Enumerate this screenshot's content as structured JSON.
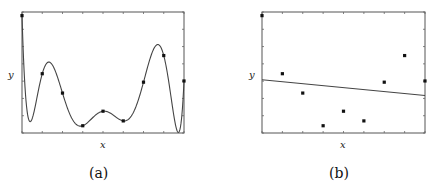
{
  "chart_data": [
    {
      "type": "line",
      "panel": "a",
      "caption": "(a)",
      "xlabel": "x",
      "ylabel": "y",
      "grid": false,
      "x_ticks": 9,
      "y_ticks": 8,
      "points": [
        {
          "x": 0,
          "y": 0.97
        },
        {
          "x": 1,
          "y": 0.49
        },
        {
          "x": 2,
          "y": 0.33
        },
        {
          "x": 3,
          "y": 0.06
        },
        {
          "x": 4,
          "y": 0.18
        },
        {
          "x": 5,
          "y": 0.1
        },
        {
          "x": 6,
          "y": 0.42
        },
        {
          "x": 7,
          "y": 0.64
        },
        {
          "x": 8,
          "y": 0.43
        }
      ],
      "fit": "high-order polynomial interpolating all points"
    },
    {
      "type": "scatter",
      "panel": "b",
      "caption": "(b)",
      "xlabel": "x",
      "ylabel": "y",
      "grid": false,
      "points": [
        {
          "x": 0,
          "y": 0.97
        },
        {
          "x": 1,
          "y": 0.49
        },
        {
          "x": 2,
          "y": 0.33
        },
        {
          "x": 3,
          "y": 0.06
        },
        {
          "x": 4,
          "y": 0.18
        },
        {
          "x": 5,
          "y": 0.1
        },
        {
          "x": 6,
          "y": 0.42
        },
        {
          "x": 7,
          "y": 0.64
        },
        {
          "x": 8,
          "y": 0.43
        }
      ],
      "fit_line": {
        "y_at_x0": 0.44,
        "y_at_x8": 0.31
      }
    }
  ],
  "labels": {
    "a_x": "x",
    "a_y": "y",
    "a_caption": "(a)",
    "b_x": "x",
    "b_y": "y",
    "b_caption": "(b)"
  }
}
